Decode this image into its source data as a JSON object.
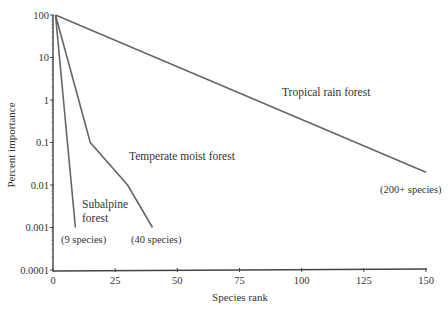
{
  "chart_data": {
    "type": "line",
    "title": "",
    "xlabel": "Species rank",
    "ylabel": "Percent importance",
    "xlim": [
      0,
      150
    ],
    "ylim": [
      0.0001,
      100
    ],
    "yscale": "log",
    "grid": false,
    "legend": "none (inline labels)",
    "x_ticks": [
      "0",
      "25",
      "50",
      "75",
      "100",
      "125",
      "150"
    ],
    "y_ticks": [
      "100",
      "10",
      "1",
      "0.1",
      "0.01",
      "0.001",
      "0.0001"
    ],
    "series": [
      {
        "name": "Tropical rain forest",
        "note": "(200+ species)",
        "points": [
          [
            1,
            100
          ],
          [
            150,
            0.02
          ]
        ]
      },
      {
        "name": "Temperate moist forest",
        "note": "(40 species)",
        "points": [
          [
            1,
            100
          ],
          [
            15,
            0.1
          ],
          [
            30,
            0.01
          ],
          [
            40,
            0.001
          ]
        ]
      },
      {
        "name": "Subalpine forest",
        "note": "(9 species)",
        "points": [
          [
            1,
            100
          ],
          [
            9,
            0.001
          ]
        ]
      }
    ]
  },
  "labels": {
    "tropical": "Tropical rain forest",
    "tropical_note": "(200+ species)",
    "temperate": "Temperate moist forest",
    "temperate_note": "(40 species)",
    "subalpine_line1": "Subalpine",
    "subalpine_line2": "forest",
    "subalpine_note": "(9 species)",
    "xlabel": "Species rank",
    "ylabel": "Percent importance"
  }
}
